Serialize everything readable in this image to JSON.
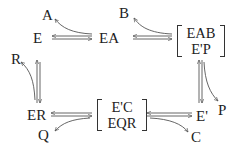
{
  "species": {
    "A": "A",
    "B": "B",
    "E": "E",
    "EA": "EA",
    "R": "R",
    "P": "P",
    "ER": "ER",
    "Q": "Q",
    "E_prime": "E'",
    "C": "C"
  },
  "complexes": {
    "top_right": {
      "line1": "EAB",
      "line2": "E'P"
    },
    "bottom_middle": {
      "line1": "E'C",
      "line2": "EQR"
    }
  },
  "reactions": [
    {
      "from": "E",
      "to": "EA",
      "binds": "A",
      "reversible": true
    },
    {
      "from": "EA",
      "to": "[EAB/E'P]",
      "binds": "B",
      "reversible": true
    },
    {
      "from": "[EAB/E'P]",
      "to": "E'",
      "releases": "P",
      "reversible": true
    },
    {
      "from": "E'",
      "to": "[E'C/EQR]",
      "binds": "C",
      "reversible": true
    },
    {
      "from": "[E'C/EQR]",
      "to": "ER",
      "releases": "Q",
      "reversible": true
    },
    {
      "from": "ER",
      "to": "E",
      "releases": "R",
      "reversible": true
    }
  ],
  "colors": {
    "ink": "#222222",
    "arrow": "#555555"
  }
}
